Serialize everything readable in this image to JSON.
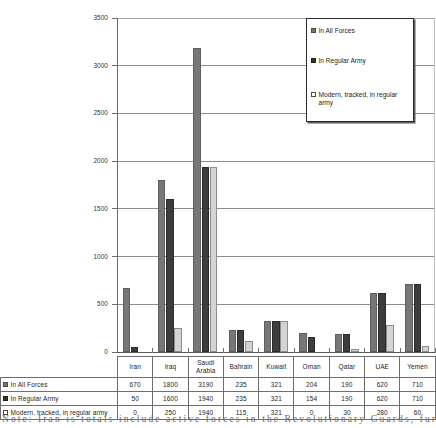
{
  "chart_data": {
    "type": "bar",
    "title": "",
    "xlabel": "",
    "ylabel": "",
    "ylim": [
      0,
      3500
    ],
    "ytick_step": 500,
    "yticks": [
      "0",
      "500",
      "1000",
      "1500",
      "2000",
      "2500",
      "3000",
      "3500"
    ],
    "grid": true,
    "legend_position": "top-right",
    "categories": [
      "Iran",
      "Iraq",
      "Saudi Arabia",
      "Bahrain",
      "Kuwait",
      "Oman",
      "Qatar",
      "UAE",
      "Yemen"
    ],
    "series": [
      {
        "name": "In All Forces",
        "color": "#777777",
        "values": [
          670,
          1800,
          3190,
          235,
          321,
          204,
          190,
          620,
          710
        ]
      },
      {
        "name": "In Regular Army",
        "color": "#3d3d3d",
        "values": [
          50,
          1600,
          1940,
          235,
          321,
          154,
          190,
          620,
          710
        ]
      },
      {
        "name": "Modern, tracked, in regular army",
        "color": "#d4d4d4",
        "values": [
          0,
          250,
          1940,
          115,
          321,
          0,
          30,
          280,
          60
        ]
      }
    ]
  },
  "legend": {
    "items": [
      {
        "label": "In All Forces"
      },
      {
        "label": "In Regular Army"
      },
      {
        "label": "Modern, tracked, in regular army"
      }
    ]
  },
  "table": {
    "corner_label": "",
    "columns": [
      "Iran",
      "Iraq",
      "Saudi Arabia",
      "Bahrain",
      "Kuwait",
      "Oman",
      "Qatar",
      "UAE",
      "Yemen"
    ],
    "rows": [
      {
        "label": "In All Forces",
        "values": [
          "670",
          "1800",
          "3190",
          "235",
          "321",
          "204",
          "190",
          "620",
          "710"
        ]
      },
      {
        "label": "In Regular Army",
        "values": [
          "50",
          "1600",
          "1940",
          "235",
          "321",
          "154",
          "190",
          "620",
          "710"
        ]
      },
      {
        "label": "Modern, tracked, in regular army",
        "values": [
          "0",
          "250",
          "1940",
          "115",
          "321",
          "0",
          "30",
          "280",
          "60"
        ]
      }
    ]
  },
  "note": {
    "text": "Note: Iran is totals include active forces in the Revolutionary Guards, funding admin, logistical"
  },
  "colors": {
    "series_all_forces": "#777777",
    "series_regular_army": "#3d3d3d",
    "series_modern_tracked": "#d4d4d4",
    "gridline": "#8c8c8c",
    "axis": "#6d6d6d"
  }
}
